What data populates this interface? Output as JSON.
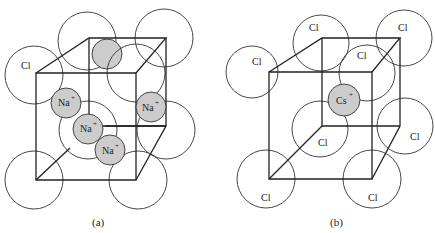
{
  "figure": {
    "panel_a": {
      "caption": "(a)",
      "compound": "NaCl",
      "anion_label": "Cl",
      "cation_label": "Na",
      "cation_charge": "+"
    },
    "panel_b": {
      "caption": "(b)",
      "compound": "CsCl",
      "anion_label": "Cl",
      "cation_label": "Cs",
      "cation_charge": "+"
    }
  }
}
